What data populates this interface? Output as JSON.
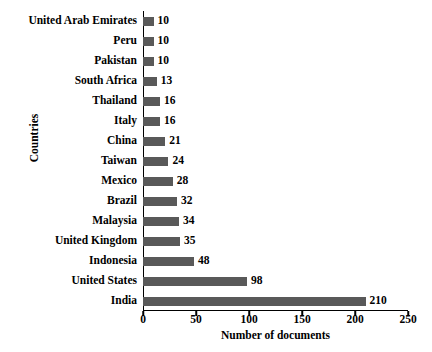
{
  "chart_data": {
    "type": "bar",
    "orientation": "horizontal",
    "title": "",
    "xlabel": "Number of documents",
    "ylabel": "Countries",
    "xlim": [
      0,
      250
    ],
    "xticks": [
      0,
      50,
      100,
      150,
      200,
      250
    ],
    "grid": false,
    "legend": null,
    "bar_color": "#595959",
    "categories": [
      "United Arab Emirates",
      "Peru",
      "Pakistan",
      "South Africa",
      "Thailand",
      "Italy",
      "China",
      "Taiwan",
      "Mexico",
      "Brazil",
      "Malaysia",
      "United Kingdom",
      "Indonesia",
      "United States",
      "India"
    ],
    "values": [
      10,
      10,
      10,
      13,
      16,
      16,
      21,
      24,
      28,
      32,
      34,
      35,
      48,
      98,
      210
    ],
    "data_labels": [
      "10",
      "10",
      "10",
      "13",
      "16",
      "16",
      "21",
      "24",
      "28",
      "32",
      "34",
      "35",
      "48",
      "98",
      "210"
    ]
  }
}
